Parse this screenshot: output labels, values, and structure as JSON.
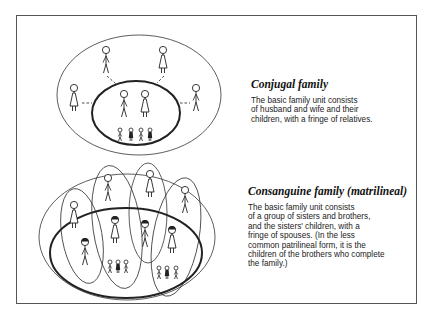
{
  "conjugal": {
    "title": "Conjugal family",
    "body_lines": [
      "The basic family unit consists",
      "of husband and wife and their",
      "children, with a fringe of relatives."
    ],
    "members": {
      "core": [
        "husband",
        "wife"
      ],
      "children_count": 4,
      "fringe_relatives_count": 4
    }
  },
  "consanguine": {
    "title": "Consanguine family (matrilineal)",
    "body_lines": [
      "The basic family unit consists",
      "of a group of sisters and brothers,",
      "and the sisters' children, with a",
      "fringe of spouses. (In the less",
      "common patrilineal form, it is the",
      "children of the brothers who complete",
      "the family.)"
    ],
    "members": {
      "siblings_count": 4,
      "spouses_count": 4,
      "child_groups": [
        3,
        3
      ]
    }
  },
  "colors": {
    "ink": "#222222",
    "frame": "#555555",
    "background": "#ffffff"
  }
}
